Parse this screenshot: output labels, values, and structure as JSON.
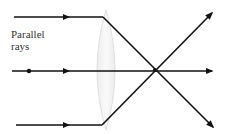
{
  "diagram": {
    "label_lines": [
      "Parallel",
      "rays"
    ],
    "colors": {
      "ray": "#111111",
      "lens_fill": "#f4f4f4",
      "lens_stroke": "#e2e2e2",
      "text": "#333333"
    },
    "lens": {
      "cx": 106,
      "top": 10,
      "bottom": 130,
      "half_width": 11
    },
    "focal_point": {
      "x": 155,
      "y": 70
    },
    "rays": [
      {
        "name": "top-ray",
        "points": [
          [
            14,
            17
          ],
          [
            103,
            17
          ],
          [
            214,
            11
          ]
        ]
      },
      {
        "name": "middle-ray",
        "points": [
          [
            12,
            71
          ],
          [
            214,
            71
          ]
        ]
      },
      {
        "name": "bottom-ray",
        "points": [
          [
            16,
            125
          ],
          [
            102,
            125
          ],
          [
            213,
            130
          ]
        ]
      }
    ]
  }
}
